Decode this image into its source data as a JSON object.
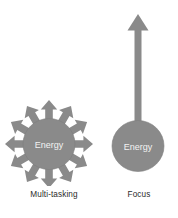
{
  "diagram": {
    "title_text": "",
    "background_color": "#ffffff",
    "shape_fill": "#8a8a8a",
    "shape_stroke": "#7c7c7c",
    "inner_label_color": "#f2f2f2",
    "caption_color": "#2b2b2b",
    "panels": [
      {
        "id": "multi-tasking",
        "caption": "Multi-tasking",
        "circle_label": "Energy",
        "arrow_count": 12,
        "arrow_direction": "radial-outward",
        "circle": {
          "cx": 49,
          "cy": 144,
          "r": 26
        },
        "arrow_ring_outer_radius": 40
      },
      {
        "id": "focus",
        "caption": "Focus",
        "circle_label": "Energy",
        "arrow_count": 1,
        "arrow_direction": "up",
        "circle": {
          "cx": 42,
          "cy": 146,
          "r": 26
        },
        "arrow": {
          "shaft_width": 7,
          "head_width": 21,
          "tip_y": 14,
          "base_y": 146
        }
      }
    ]
  }
}
